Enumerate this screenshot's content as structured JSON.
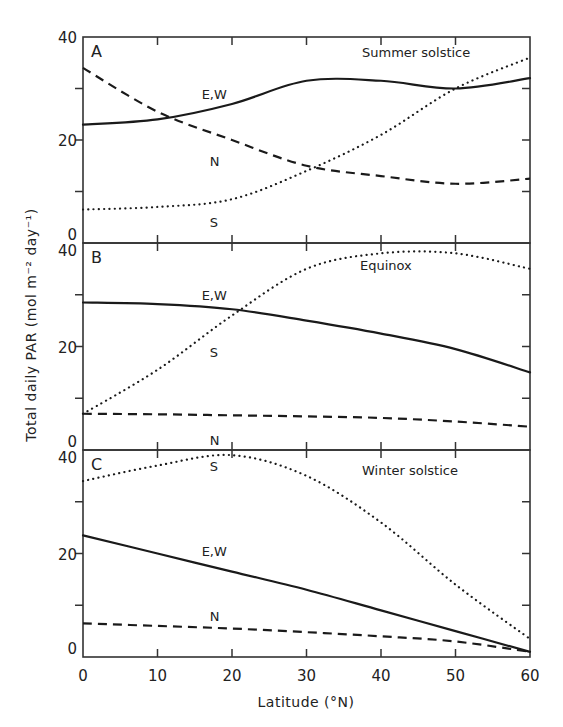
{
  "figure": {
    "ylabel": "Total daily PAR (mol m⁻² day⁻¹)",
    "xlabel": "Latitude (°N)",
    "x_ticks": [
      "0",
      "10",
      "20",
      "30",
      "40",
      "50",
      "60"
    ],
    "y_ticks": [
      "0",
      "20",
      "40"
    ]
  },
  "chart_data": [
    {
      "type": "line",
      "panel": "A",
      "title": "Summer solstice",
      "xlabel": "Latitude (°N)",
      "ylabel": "Total daily PAR (mol m-2 day-1)",
      "x": [
        0,
        10,
        20,
        30,
        40,
        50,
        60
      ],
      "xlim": [
        0,
        60
      ],
      "ylim": [
        0,
        40
      ],
      "series": [
        {
          "name": "E,W",
          "style": "solid",
          "values": [
            23,
            24,
            27,
            31.5,
            31.5,
            30,
            32
          ]
        },
        {
          "name": "N",
          "style": "dashed",
          "values": [
            34,
            25.5,
            20,
            15,
            13,
            11.5,
            12.5
          ]
        },
        {
          "name": "S",
          "style": "dotted",
          "values": [
            6.5,
            7,
            8.5,
            14,
            21,
            30,
            36
          ]
        }
      ],
      "labels": [
        {
          "text": "E,W",
          "x": 17,
          "y": 29
        },
        {
          "text": "N",
          "x": 17,
          "y": 16
        },
        {
          "text": "S",
          "x": 17,
          "y": 4
        }
      ]
    },
    {
      "type": "line",
      "panel": "B",
      "title": "Equinox",
      "xlabel": "Latitude (°N)",
      "ylabel": "Total daily PAR (mol m-2 day-1)",
      "x": [
        0,
        10,
        20,
        30,
        40,
        50,
        60
      ],
      "xlim": [
        0,
        60
      ],
      "ylim": [
        0,
        40
      ],
      "series": [
        {
          "name": "E,W",
          "style": "solid",
          "values": [
            28.5,
            28.2,
            27.2,
            25,
            22.5,
            19.5,
            15
          ]
        },
        {
          "name": "S",
          "style": "dotted",
          "values": [
            7,
            15.5,
            26,
            35,
            38,
            38,
            35
          ]
        },
        {
          "name": "N",
          "style": "dashed",
          "values": [
            7,
            6.9,
            6.7,
            6.5,
            6.2,
            5.5,
            4.5
          ]
        }
      ],
      "labels": [
        {
          "text": "E,W",
          "x": 17,
          "y": 30
        },
        {
          "text": "S",
          "x": 17,
          "y": 19
        },
        {
          "text": "N",
          "x": 17,
          "y": 2
        }
      ]
    },
    {
      "type": "line",
      "panel": "C",
      "title": "Winter solstice",
      "xlabel": "Latitude (°N)",
      "ylabel": "Total daily PAR (mol m-2 day-1)",
      "x": [
        0,
        10,
        20,
        30,
        40,
        50,
        60
      ],
      "xlim": [
        0,
        60
      ],
      "ylim": [
        0,
        40
      ],
      "series": [
        {
          "name": "S",
          "style": "dotted",
          "values": [
            34,
            37,
            39,
            35,
            26,
            14,
            3.5
          ]
        },
        {
          "name": "E,W",
          "style": "solid",
          "values": [
            23.5,
            20,
            16.5,
            13,
            9,
            5,
            1
          ]
        },
        {
          "name": "N",
          "style": "dashed",
          "values": [
            6.5,
            6,
            5.5,
            4.8,
            4,
            3,
            1
          ]
        }
      ],
      "labels": [
        {
          "text": "S",
          "x": 17,
          "y": 37
        },
        {
          "text": "E,W",
          "x": 17,
          "y": 20.5
        },
        {
          "text": "N",
          "x": 17,
          "y": 8
        }
      ]
    }
  ]
}
